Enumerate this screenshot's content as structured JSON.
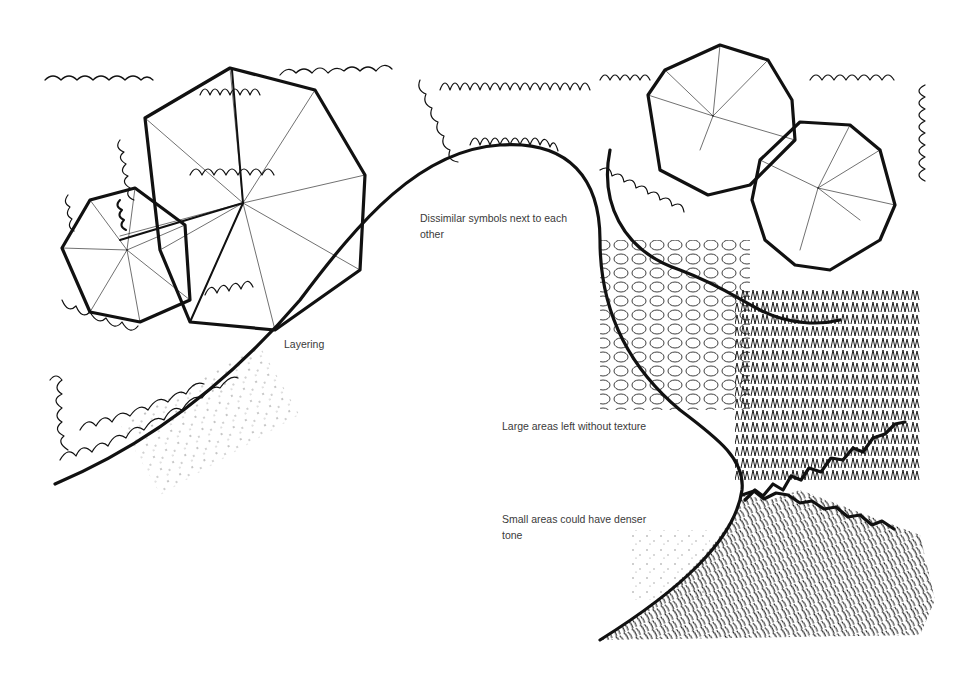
{
  "figure": {
    "type": "landscape plan graphic symbols illustration",
    "style": "black ink pen drawing on white",
    "background": "#ffffff",
    "ink_color": "#111111",
    "label_color": "#3a3a3a"
  },
  "annotations": {
    "dissimilar": {
      "line1": "Dissimilar symbols next to each",
      "line2": "other"
    },
    "layering": {
      "text": "Layering"
    },
    "large_areas": {
      "text": "Large areas left without texture"
    },
    "small_areas": {
      "line1": "Small areas could have denser",
      "line2": "tone"
    }
  },
  "symbols": [
    {
      "name": "large-canopy-tree-polygon",
      "region": "top-left"
    },
    {
      "name": "small-canopy-tree-polygon",
      "region": "left"
    },
    {
      "name": "scalloped-shrub-mass",
      "region": "top-center"
    },
    {
      "name": "twin-round-trees",
      "region": "top-right"
    },
    {
      "name": "looped-groundcover-band",
      "region": "right-center"
    },
    {
      "name": "spiky-grass-mass",
      "region": "right"
    },
    {
      "name": "hatched-groundcover",
      "region": "bottom-right"
    },
    {
      "name": "curving-bed-edge",
      "region": "center"
    }
  ]
}
